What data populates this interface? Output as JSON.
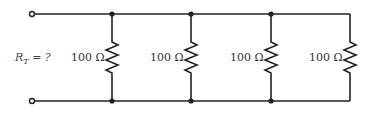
{
  "diagram": {
    "type": "parallel-resistor-circuit",
    "equivalent_label": {
      "symbol": "R",
      "subscript": "T",
      "suffix": " = ?"
    },
    "resistors": [
      {
        "value": "100 Ω",
        "x": 112
      },
      {
        "value": "100 Ω",
        "x": 191
      },
      {
        "value": "100 Ω",
        "x": 271
      },
      {
        "value": "100 Ω",
        "x": 350
      }
    ],
    "terminals": [
      "top-terminal",
      "bottom-terminal"
    ],
    "colors": {
      "wire": "#222222",
      "text": "#333333",
      "background": "#ffffff"
    }
  }
}
